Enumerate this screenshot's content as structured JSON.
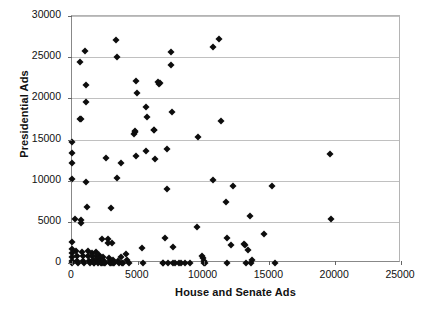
{
  "chart_data": {
    "type": "scatter",
    "title": "",
    "xlabel": "House and Senate Ads",
    "ylabel": "Presidential Ads",
    "xlim": [
      0,
      25000
    ],
    "ylim": [
      0,
      30000
    ],
    "xticks": [
      0,
      5000,
      10000,
      15000,
      20000,
      25000
    ],
    "yticks": [
      0,
      5000,
      10000,
      15000,
      20000,
      25000,
      30000
    ],
    "xtick_labels": [
      "0",
      "5000",
      "10000",
      "15000",
      "20000",
      "25000"
    ],
    "ytick_labels": [
      "0",
      "5000",
      "10000",
      "15000",
      "20000",
      "25000",
      "30000"
    ],
    "grid": "horizontal",
    "legend": "none",
    "marker": "diamond",
    "marker_color": "#0d0d0d",
    "gridline_color": "#c0c0c0",
    "axis_color": "#888888",
    "series": [
      {
        "name": "observations",
        "points": [
          [
            0,
            10200
          ],
          [
            0,
            13400
          ],
          [
            0,
            12200
          ],
          [
            0,
            14700
          ],
          [
            0,
            2600
          ],
          [
            0,
            1700
          ],
          [
            0,
            1200
          ],
          [
            0,
            700
          ],
          [
            0,
            300
          ],
          [
            0,
            0
          ],
          [
            250,
            5300
          ],
          [
            300,
            1500
          ],
          [
            350,
            900
          ],
          [
            400,
            250
          ],
          [
            420,
            0
          ],
          [
            600,
            24400
          ],
          [
            620,
            17500
          ],
          [
            650,
            17450
          ],
          [
            700,
            5200
          ],
          [
            720,
            4900
          ],
          [
            760,
            1300
          ],
          [
            800,
            800
          ],
          [
            850,
            250
          ],
          [
            880,
            0
          ],
          [
            1000,
            25800
          ],
          [
            1050,
            21600
          ],
          [
            1080,
            19500
          ],
          [
            1100,
            9800
          ],
          [
            1150,
            6800
          ],
          [
            1200,
            1400
          ],
          [
            1250,
            900
          ],
          [
            1300,
            300
          ],
          [
            1350,
            0
          ],
          [
            1500,
            1250
          ],
          [
            1550,
            800
          ],
          [
            1600,
            400
          ],
          [
            1650,
            0
          ],
          [
            1700,
            0
          ],
          [
            1800,
            1300
          ],
          [
            1850,
            900
          ],
          [
            1900,
            500
          ],
          [
            1950,
            200
          ],
          [
            2000,
            0
          ],
          [
            2050,
            1000
          ],
          [
            2100,
            600
          ],
          [
            2150,
            300
          ],
          [
            2200,
            0
          ],
          [
            2250,
            0
          ],
          [
            2300,
            2950
          ],
          [
            2350,
            700
          ],
          [
            2400,
            300
          ],
          [
            2450,
            0
          ],
          [
            2500,
            0
          ],
          [
            2600,
            12700
          ],
          [
            2700,
            2900
          ],
          [
            2750,
            2400
          ],
          [
            2800,
            600
          ],
          [
            2850,
            200
          ],
          [
            2900,
            0
          ],
          [
            2950,
            0
          ],
          [
            3000,
            6700
          ],
          [
            3050,
            2400
          ],
          [
            3100,
            400
          ],
          [
            3150,
            0
          ],
          [
            3200,
            0
          ],
          [
            3350,
            27100
          ],
          [
            3400,
            25000
          ],
          [
            3450,
            10300
          ],
          [
            3500,
            300
          ],
          [
            3550,
            0
          ],
          [
            3700,
            12100
          ],
          [
            3750,
            700
          ],
          [
            3800,
            0
          ],
          [
            3900,
            0
          ],
          [
            4100,
            1100
          ],
          [
            4200,
            400
          ],
          [
            4300,
            0
          ],
          [
            4700,
            15700
          ],
          [
            4750,
            15900
          ],
          [
            4800,
            16050
          ],
          [
            4850,
            22100
          ],
          [
            4900,
            12950
          ],
          [
            4950,
            20700
          ],
          [
            5300,
            1800
          ],
          [
            5400,
            0
          ],
          [
            5600,
            18900
          ],
          [
            5650,
            13600
          ],
          [
            5700,
            17700
          ],
          [
            6200,
            16100
          ],
          [
            6250,
            16150
          ],
          [
            6300,
            12600
          ],
          [
            6550,
            22000
          ],
          [
            6600,
            21800
          ],
          [
            6650,
            21900
          ],
          [
            6900,
            0
          ],
          [
            6950,
            0
          ],
          [
            7100,
            3000
          ],
          [
            7200,
            13800
          ],
          [
            7250,
            8950
          ],
          [
            7300,
            0
          ],
          [
            7500,
            24100
          ],
          [
            7550,
            25600
          ],
          [
            7600,
            18400
          ],
          [
            7650,
            1950
          ],
          [
            7700,
            0
          ],
          [
            7800,
            0
          ],
          [
            8100,
            0
          ],
          [
            8300,
            0
          ],
          [
            8600,
            0
          ],
          [
            9000,
            0
          ],
          [
            9500,
            4400
          ],
          [
            9550,
            15350
          ],
          [
            9900,
            900
          ],
          [
            9950,
            600
          ],
          [
            10000,
            300
          ],
          [
            10050,
            0
          ],
          [
            10100,
            0
          ],
          [
            10700,
            26200
          ],
          [
            10750,
            10050
          ],
          [
            11200,
            27250
          ],
          [
            11300,
            17200
          ],
          [
            11700,
            7400
          ],
          [
            11750,
            3000
          ],
          [
            11800,
            0
          ],
          [
            12100,
            2150
          ],
          [
            12200,
            9300
          ],
          [
            13100,
            2300
          ],
          [
            13150,
            2200
          ],
          [
            13200,
            0
          ],
          [
            13400,
            1600
          ],
          [
            13500,
            5700
          ],
          [
            13600,
            0
          ],
          [
            13700,
            400
          ],
          [
            14600,
            3550
          ],
          [
            15200,
            9400
          ],
          [
            15400,
            0
          ],
          [
            19600,
            13200
          ],
          [
            19650,
            5350
          ]
        ]
      }
    ]
  }
}
